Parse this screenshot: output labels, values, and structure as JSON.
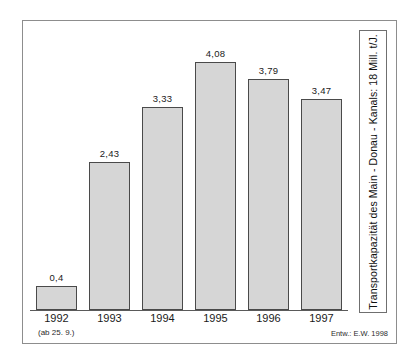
{
  "figure": {
    "caption_vertical": "Transportkapazität des Main - Donau - Kanals: 18 Mill. t/J.",
    "footnote": "(ab 25. 9.)",
    "attribution": "Entw.: E.W. 1998"
  },
  "chart_data": {
    "type": "bar",
    "title": "",
    "xlabel": "",
    "ylabel": "",
    "categories": [
      "1992",
      "1993",
      "1994",
      "1995",
      "1996",
      "1997"
    ],
    "values": [
      0.4,
      2.43,
      3.33,
      4.08,
      3.79,
      3.47
    ],
    "value_labels": [
      "0,4",
      "2,43",
      "3,33",
      "4,08",
      "3,79",
      "3,47"
    ],
    "unit": "Mill. t/J.",
    "ylim": [
      0,
      4.6
    ],
    "grid": false,
    "legend": null,
    "annotations": [
      "(ab 25. 9.)",
      "Entw.: E.W. 1998",
      "Transportkapazität des Main - Donau - Kanals: 18 Mill. t/J."
    ],
    "colors": {
      "bar_fill": "#d6d6d6",
      "bar_border": "#4a4a4a",
      "axis": "#5a5a5a",
      "frame": "#8d8d8d",
      "text": "#1a1a1a"
    }
  }
}
